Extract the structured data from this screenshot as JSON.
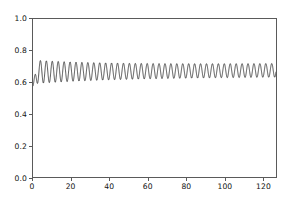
{
  "figure": {
    "background_color": "#ffffff",
    "axes_color": "#5a5a5a",
    "line_color": "#1a1a1a"
  },
  "chart_data": {
    "type": "line",
    "title": "",
    "xlabel": "",
    "ylabel": "",
    "xlim": [
      0,
      127
    ],
    "ylim": [
      0.0,
      1.0
    ],
    "grid": false,
    "legend_position": "none",
    "xticks": [
      0,
      20,
      40,
      60,
      80,
      100,
      120
    ],
    "yticks": [
      0.0,
      0.2,
      0.4,
      0.6,
      0.8,
      1.0
    ],
    "xtick_labels": [
      "0",
      "20",
      "40",
      "60",
      "80",
      "100",
      "120"
    ],
    "ytick_labels": [
      "0.0",
      "0.2",
      "0.4",
      "0.6",
      "0.8",
      "1.0"
    ],
    "series": [
      {
        "name": "signal",
        "description": "High-frequency oscillation settling to a steady mean with slowly decaying amplitude",
        "oscillation_period": 3.1,
        "mean_start": 0.665,
        "mean_end": 0.675,
        "amplitude_start": 0.075,
        "amplitude_end": 0.042,
        "initial_value": 0.575,
        "peak_max": 0.745,
        "trough_min": 0.585,
        "x_start": 0,
        "x_end": 127
      }
    ]
  }
}
